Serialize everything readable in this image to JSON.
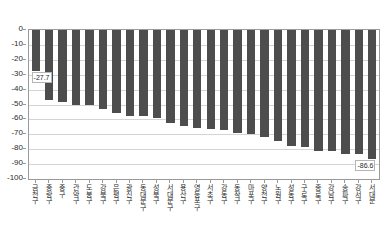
{
  "chart_data": {
    "type": "bar",
    "title": "",
    "subtitle": "",
    "xlabel": "",
    "ylabel": "",
    "ylim": [
      -100,
      0
    ],
    "grid": true,
    "legend": null,
    "bar_color": "#4d4d4d",
    "axis_color": "#9a9a9a",
    "gridline_color": "#d4d4d4",
    "ytick_labels": [
      "0",
      "-10",
      "-20",
      "-30",
      "-40",
      "-50",
      "-60",
      "-70",
      "-80",
      "-90",
      "-100"
    ],
    "ytick_values": [
      0,
      -10,
      -20,
      -30,
      -40,
      -50,
      -60,
      -70,
      -80,
      -90,
      -100
    ],
    "categories": [
      "금천구",
      "중랑구",
      "중구",
      "관악구",
      "도봉구",
      "강북구",
      "은평구",
      "광진구",
      "동대문구",
      "성북구",
      "서대문구",
      "용산구",
      "영등포구",
      "서초구",
      "강동구",
      "동작구",
      "마포구",
      "양천구",
      "노원구",
      "성동구",
      "구로구",
      "종로구",
      "강남구",
      "송파구",
      "강서구",
      "서대문"
    ],
    "values": [
      -27.7,
      -47.0,
      -48.0,
      -50.2,
      -50.5,
      -53.3,
      -56.0,
      -57.5,
      -58.0,
      -59.0,
      -62.5,
      -64.5,
      -66.0,
      -66.2,
      -67.0,
      -69.0,
      -69.5,
      -71.5,
      -74.5,
      -78.0,
      -78.5,
      -81.5,
      -81.5,
      -83.0,
      -83.5,
      -86.6
    ],
    "data_labels": [
      {
        "index": 0,
        "text": "-27.7"
      },
      {
        "index": 25,
        "text": "-86.6"
      }
    ]
  }
}
